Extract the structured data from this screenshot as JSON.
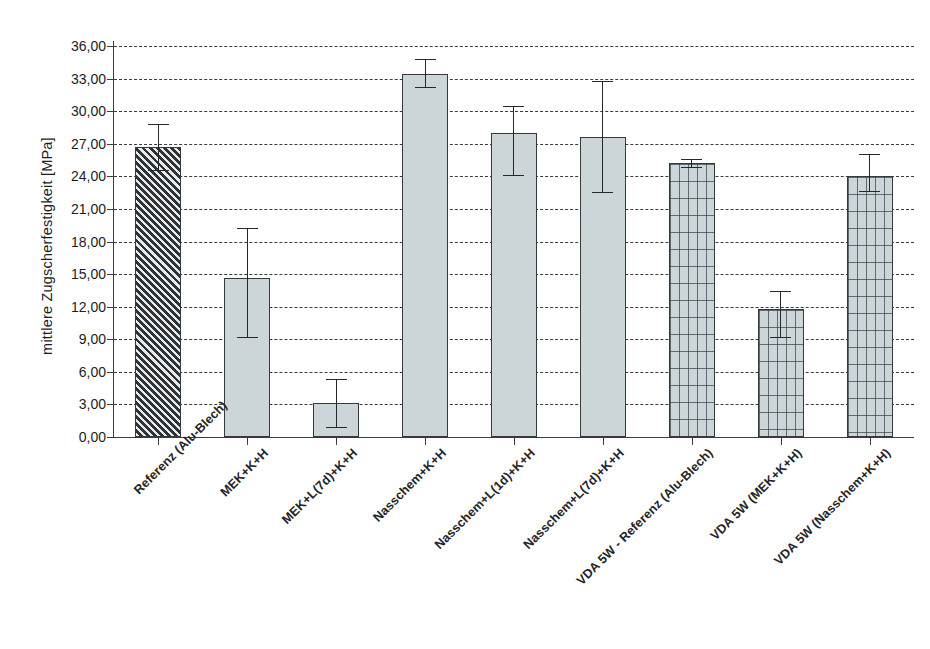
{
  "chart_data": {
    "type": "bar",
    "title": "",
    "xlabel": "",
    "ylabel": "mittlere Zugscherfestigkeit [MPa]",
    "ylim": [
      0,
      36
    ],
    "ytick_step": 3,
    "grid": true,
    "legend": "none",
    "ytick_labels": [
      "36,00",
      "33,00",
      "30,00",
      "27,00",
      "24,00",
      "21,00",
      "18,00",
      "15,00",
      "12,00",
      "9,00",
      "6,00",
      "3,00",
      "0,00"
    ],
    "ytick_values": [
      36,
      33,
      30,
      27,
      24,
      21,
      18,
      15,
      12,
      9,
      6,
      3,
      0
    ],
    "categories": [
      "Referenz (Alu-Blech)",
      "MEK+K+H",
      "MEK+L(7d)+K+H",
      "Nasschem+K+H",
      "Nasschem+L(1d)+K+H",
      "Nasschem+L(7d)+K+H",
      "VDA 5W - Referenz (Alu-Blech)",
      "VDA 5W (MEK+K+H)",
      "VDA 5W (Nasschem+K+H)"
    ],
    "values": [
      26.7,
      14.6,
      3.1,
      33.4,
      28.0,
      27.6,
      25.2,
      11.8,
      24.0
    ],
    "error_high": [
      28.8,
      19.2,
      5.3,
      34.8,
      30.5,
      32.8,
      25.6,
      13.4,
      26.1
    ],
    "error_low": [
      24.5,
      9.1,
      0.8,
      32.1,
      24.0,
      22.5,
      24.8,
      9.1,
      22.6
    ],
    "fill_patterns": [
      "hatch",
      "solid",
      "solid",
      "solid",
      "solid",
      "solid",
      "grid",
      "grid",
      "grid"
    ],
    "colors": {
      "bar_fill": "#ccd5d8",
      "bar_edge": "#33393d",
      "hatch_dark": "#2e3338",
      "grid_line": "#3c3c3c",
      "error_bar": "#23282c",
      "text": "#1d1d1d",
      "background": "#ffffff"
    }
  }
}
